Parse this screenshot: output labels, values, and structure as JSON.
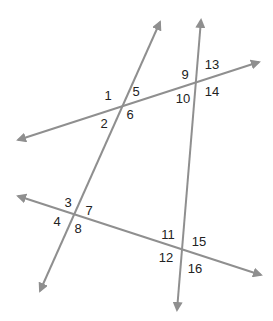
{
  "diagram": {
    "type": "transversal-lines",
    "line_color": "#8f8f8f",
    "label_color": "#222222",
    "lines": [
      {
        "id": "transversal-left",
        "x1": 40,
        "y1": 291,
        "x2": 160,
        "y2": 22
      },
      {
        "id": "transversal-right",
        "x1": 177,
        "y1": 310,
        "x2": 201,
        "y2": 20
      },
      {
        "id": "line-upper",
        "x1": 18,
        "y1": 140,
        "x2": 259,
        "y2": 62
      },
      {
        "id": "line-lower",
        "x1": 18,
        "y1": 196,
        "x2": 261,
        "y2": 275
      }
    ],
    "angles": [
      {
        "label": "1",
        "x": 108,
        "y": 100
      },
      {
        "label": "2",
        "x": 104,
        "y": 128
      },
      {
        "label": "3",
        "x": 68,
        "y": 207
      },
      {
        "label": "4",
        "x": 57,
        "y": 226
      },
      {
        "label": "5",
        "x": 136,
        "y": 96
      },
      {
        "label": "6",
        "x": 130,
        "y": 119
      },
      {
        "label": "7",
        "x": 89,
        "y": 215
      },
      {
        "label": "8",
        "x": 78,
        "y": 233
      },
      {
        "label": "9",
        "x": 185,
        "y": 79
      },
      {
        "label": "10",
        "x": 183,
        "y": 103
      },
      {
        "label": "11",
        "x": 168,
        "y": 239
      },
      {
        "label": "12",
        "x": 166,
        "y": 262
      },
      {
        "label": "13",
        "x": 212,
        "y": 69
      },
      {
        "label": "14",
        "x": 212,
        "y": 96
      },
      {
        "label": "15",
        "x": 199,
        "y": 246
      },
      {
        "label": "16",
        "x": 195,
        "y": 273
      }
    ]
  }
}
